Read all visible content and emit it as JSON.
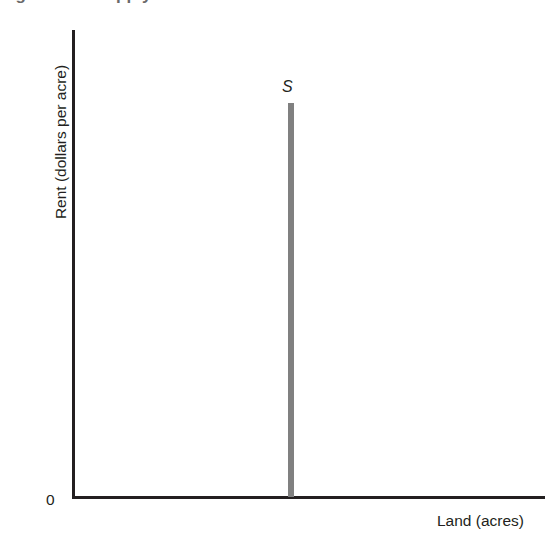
{
  "figure": {
    "title_sliver": "Figure  The Supply of Land",
    "background_color": "#ffffff",
    "axis_color": "#231f20",
    "curve_color": "#808080",
    "text_color": "#231f20"
  },
  "axes": {
    "y_label": "Rent (dollars per acre)",
    "x_label": "Land (acres)",
    "origin_label": "0"
  },
  "curve": {
    "label": "S"
  },
  "chart_data": {
    "type": "line",
    "title": "The Supply of Land",
    "xlabel": "Land (acres)",
    "ylabel": "Rent (dollars per acre)",
    "xlim": [
      0,
      100
    ],
    "ylim": [
      0,
      100
    ],
    "grid": false,
    "legend": "none",
    "axis_tick_labels": {
      "x": [],
      "y": [
        "0"
      ]
    },
    "series": [
      {
        "name": "S",
        "description": "Perfectly inelastic (vertical) supply curve for land",
        "color": "#808080",
        "linewidth": 6,
        "x": [
          46,
          46
        ],
        "y": [
          0,
          84
        ]
      }
    ],
    "annotations": [
      {
        "text": "S",
        "x": 46,
        "y": 89,
        "style": "italic",
        "description": "Supply curve label above the vertical line"
      },
      {
        "text": "0",
        "x": -4,
        "y": -3,
        "style": "normal",
        "description": "Origin label at lower-left of axes"
      }
    ]
  }
}
